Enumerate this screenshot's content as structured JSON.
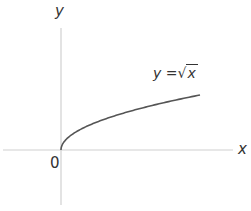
{
  "diagram": {
    "x_axis_label": "x",
    "y_axis_label": "y",
    "origin_label": "0",
    "function_label": {
      "lhs": "y",
      "equals": "=",
      "radical": "√",
      "radicand": "x"
    },
    "colors": {
      "axis": "#d0d0d0",
      "curve": "#555555",
      "text": "#333333"
    }
  },
  "chart_data": {
    "type": "line",
    "xlabel": "x",
    "ylabel": "y",
    "series": [
      {
        "name": "y = √x",
        "x": [
          0,
          0.25,
          1,
          2.25,
          4,
          6.25,
          9
        ],
        "values": [
          0,
          0.5,
          1,
          1.5,
          2,
          2.5,
          3
        ]
      }
    ],
    "grid": false,
    "origin_label": "0"
  }
}
